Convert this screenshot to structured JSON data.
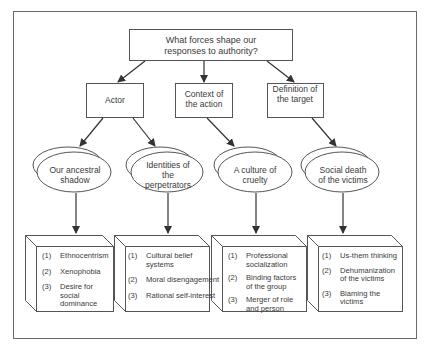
{
  "title": "What forces shape our responses to authority?",
  "factors": [
    {
      "label": "Actor",
      "subfactors": [
        {
          "label": "Our ancestral shadow",
          "items": [
            "Ethnocentrism",
            "Xenophobia",
            "Desire for social dominance"
          ]
        },
        {
          "label": "Identities of the perpetrators",
          "items": [
            "Cultural belief systems",
            "Moral disengagement",
            "Rational self-interest"
          ]
        }
      ]
    },
    {
      "label": "Context of the action",
      "subfactors": [
        {
          "label": "A culture of cruelty",
          "items": [
            "Professional socialization",
            "Binding factors of the group",
            "Merger of role and person"
          ]
        }
      ]
    },
    {
      "label": "Definition of the target",
      "subfactors": [
        {
          "label": "Social death of the victims",
          "items": [
            "Us-them thinking",
            "Dehumanization of the victims",
            "Blaming the victims"
          ]
        }
      ]
    }
  ],
  "numbers": [
    "(1)",
    "(2)",
    "(3)"
  ],
  "colors": {
    "line": "#555555",
    "frame": "#6a6a6a",
    "text": "#3a3a3a",
    "background": "#ffffff"
  }
}
